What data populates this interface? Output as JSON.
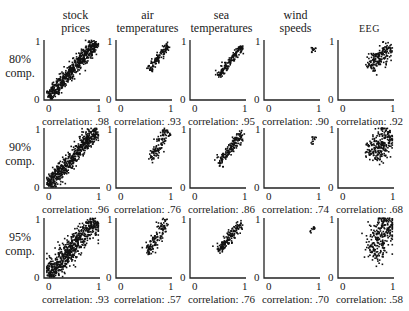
{
  "chart_data": {
    "type": "scatter",
    "title": "",
    "layout": "grid 3 rows x 5 columns of scatter plots",
    "columns": [
      "stock prices",
      "air temperatures",
      "sea temperatures",
      "wind speeds",
      "EEG"
    ],
    "rows": [
      "80% comp.",
      "90% comp.",
      "95% comp."
    ],
    "axis_range": [
      0,
      1
    ],
    "tick_labels": {
      "x": [
        "0",
        "1"
      ],
      "y": [
        "0",
        "1"
      ]
    },
    "grid": false,
    "correlations": [
      [
        0.98,
        0.93,
        0.95,
        0.9,
        0.92
      ],
      [
        0.96,
        0.76,
        0.86,
        0.74,
        0.68
      ],
      [
        0.93,
        0.57,
        0.76,
        0.7,
        0.58
      ]
    ],
    "clusters": [
      [
        {
          "x0": 0.05,
          "y0": 0.05,
          "x1": 0.95,
          "y1": 0.95,
          "spread": 0.05,
          "n": 600
        },
        {
          "x0": 0.6,
          "y0": 0.5,
          "x1": 0.95,
          "y1": 0.92,
          "spread": 0.03,
          "n": 120
        },
        {
          "x0": 0.5,
          "y0": 0.4,
          "x1": 0.95,
          "y1": 0.9,
          "spread": 0.03,
          "n": 160
        },
        {
          "x0": 0.86,
          "y0": 0.78,
          "x1": 0.93,
          "y1": 0.86,
          "spread": 0.02,
          "n": 12
        },
        {
          "x0": 0.55,
          "y0": 0.55,
          "x1": 0.95,
          "y1": 0.88,
          "spread": 0.07,
          "n": 180
        }
      ],
      [
        {
          "x0": 0.05,
          "y0": 0.05,
          "x1": 0.95,
          "y1": 0.95,
          "spread": 0.06,
          "n": 600
        },
        {
          "x0": 0.6,
          "y0": 0.45,
          "x1": 0.95,
          "y1": 0.95,
          "spread": 0.05,
          "n": 120
        },
        {
          "x0": 0.5,
          "y0": 0.4,
          "x1": 0.95,
          "y1": 0.92,
          "spread": 0.04,
          "n": 160
        },
        {
          "x0": 0.86,
          "y0": 0.75,
          "x1": 0.94,
          "y1": 0.87,
          "spread": 0.02,
          "n": 12
        },
        {
          "x0": 0.6,
          "y0": 0.5,
          "x1": 0.95,
          "y1": 0.95,
          "spread": 0.1,
          "n": 240
        }
      ],
      [
        {
          "x0": 0.05,
          "y0": 0.05,
          "x1": 0.95,
          "y1": 0.95,
          "spread": 0.08,
          "n": 650
        },
        {
          "x0": 0.55,
          "y0": 0.4,
          "x1": 0.92,
          "y1": 0.95,
          "spread": 0.05,
          "n": 130
        },
        {
          "x0": 0.5,
          "y0": 0.45,
          "x1": 0.95,
          "y1": 0.92,
          "spread": 0.04,
          "n": 160
        },
        {
          "x0": 0.85,
          "y0": 0.72,
          "x1": 0.92,
          "y1": 0.85,
          "spread": 0.02,
          "n": 12
        },
        {
          "x0": 0.6,
          "y0": 0.35,
          "x1": 0.95,
          "y1": 0.98,
          "spread": 0.12,
          "n": 260
        }
      ]
    ]
  },
  "labels": {
    "col_titles": [
      {
        "l1": "stock",
        "l2": "prices"
      },
      {
        "l1": "air",
        "l2": "temperatures"
      },
      {
        "l1": "sea",
        "l2": "temperatures"
      },
      {
        "l1": "wind",
        "l2": "speeds"
      },
      {
        "l1": "",
        "l2": "EEG"
      }
    ],
    "row_labels": [
      {
        "l1": "80%",
        "l2": "comp."
      },
      {
        "l1": "90%",
        "l2": "comp."
      },
      {
        "l1": "95%",
        "l2": "comp."
      }
    ],
    "corr_text": [
      [
        "correlation: .98",
        "correlation: .93",
        "correlation: .95",
        "correlation: .90",
        "correlation: .92"
      ],
      [
        "correlation: .96",
        "correlation: .76",
        "correlation: .86",
        "correlation: .74",
        "correlation: .68"
      ],
      [
        "correlation: .93",
        "correlation: .57",
        "correlation: .76",
        "correlation: .70",
        "correlation: .58"
      ]
    ],
    "tick_zero": "0",
    "tick_one": "1"
  }
}
